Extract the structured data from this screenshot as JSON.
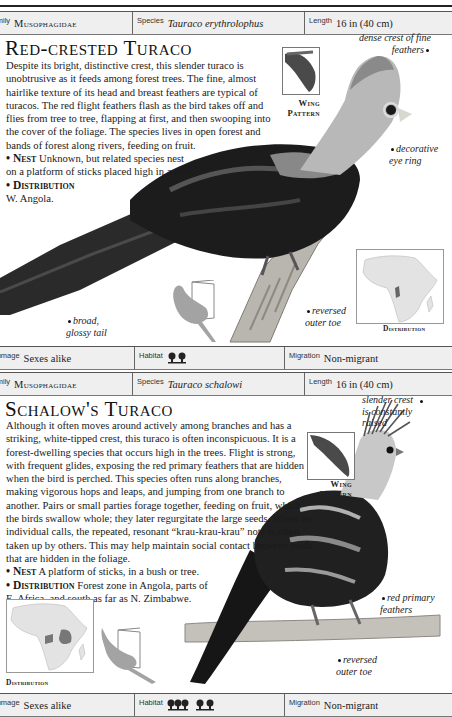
{
  "entries": [
    {
      "family_label": "Family",
      "family": "Musophagidae",
      "species_label": "Species",
      "species": "Tauraco erythrolophus",
      "length_label": "Length",
      "length": "16 in (40 cm)",
      "title": "Red-crested Turaco",
      "description": "Despite its bright, distinctive crest, this slender turaco is unobtrusive as it feeds among forest trees. The fine, almost hairlike texture of its head and breast feathers are typical of turacos. The red flight feathers flash as the bird takes off and flies from tree to tree, flapping at first, and then swooping into the cover of the foliage. The species lives in open forest and bands of forest along rivers, feeding on fruit.",
      "nest_label": "Nest",
      "nest": "Unknown, but related species nest on a platform of sticks placed high in a tree.",
      "distribution_label": "Distribution",
      "distribution": "W. Angola.",
      "wing_label_1": "Wing",
      "wing_label_2": "Pattern",
      "annotations": {
        "crest": "dense crest of fine feathers",
        "eye": "decorative eye ring",
        "tail": "broad, glossy tail",
        "toe": "reversed outer toe"
      },
      "map_label": "Distribution",
      "plumage_label": "Plumage",
      "plumage": "Sexes alike",
      "habitat_label": "Habitat",
      "habitat_icons": [
        "forest-edge-icon"
      ],
      "migration_label": "Migration",
      "migration": "Non-migrant"
    },
    {
      "family_label": "Family",
      "family": "Musophagidae",
      "species_label": "Species",
      "species": "Tauraco schalowi",
      "length_label": "Length",
      "length": "16 in (40 cm)",
      "title": "Schalow's Turaco",
      "description": "Although it often moves around actively among branches and has a striking, white-tipped crest, this turaco is often inconspicuous. It is a forest-dwelling species that occurs high in the trees. Flight is strong, with frequent glides, exposing the red primary feathers that are hidden when the bird is perched. This species often runs along branches, making vigorous hops and leaps, and jumping from one branch to another. Pairs or small parties forage together, feeding on fruit, which the birds swallow whole; they later regurgitate the large seeds. When an individual calls, the repeated, resonant “krau-krau-krau” note is often taken up by others. This may help maintain social contact between birds that are hidden in the foliage.",
      "nest_label": "Nest",
      "nest": "A platform of sticks, in a bush or tree.",
      "distribution_label": "Distribution",
      "distribution": "Forest zone in Angola, parts of E. Africa, and south as far as N. Zimbabwe.",
      "wing_label_1": "Wing",
      "wing_label_2": "Pattern",
      "annotations": {
        "crest": "slender crest is constantly raised",
        "primaries": "red primary feathers",
        "toe": "reversed outer toe"
      },
      "map_label": "Distribution",
      "plumage_label": "Plumage",
      "plumage": "Sexes alike",
      "habitat_label": "Habitat",
      "habitat_icons": [
        "dense-forest-icon",
        "forest-edge-icon"
      ],
      "migration_label": "Migration",
      "migration": "Non-migrant"
    }
  ]
}
